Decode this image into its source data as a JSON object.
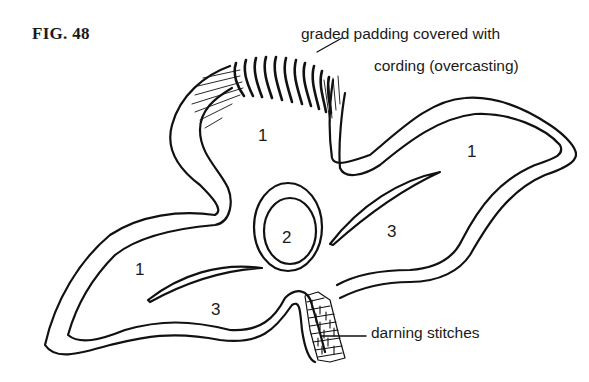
{
  "figure": {
    "title": "FIG. 48",
    "stroke_color": "#111111",
    "background_color": "#ffffff"
  },
  "callouts": {
    "padding_line1": "graded padding covered with",
    "padding_line2": "cording (overcasting)",
    "darning": "darning stitches"
  },
  "regions": [
    {
      "id": "top-petal",
      "label": "1"
    },
    {
      "id": "right-petal",
      "label": "1"
    },
    {
      "id": "left-petal",
      "label": "1"
    },
    {
      "id": "center-circle",
      "label": "2"
    },
    {
      "id": "right-inner",
      "label": "3"
    },
    {
      "id": "left-inner",
      "label": "3"
    }
  ]
}
